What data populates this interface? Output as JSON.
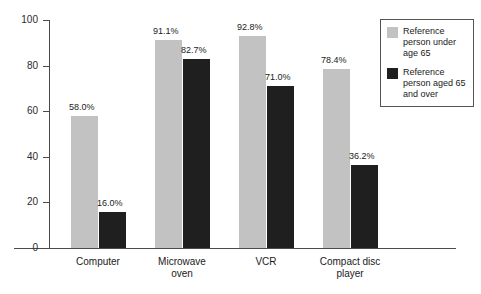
{
  "chart_data": {
    "type": "bar",
    "title": "",
    "subtitle": "",
    "xlabel": "",
    "ylabel": "",
    "ylim": [
      0,
      100
    ],
    "yticks": [
      "0",
      "20",
      "40",
      "60",
      "80",
      "100"
    ],
    "ytick_values": [
      0,
      20,
      40,
      60,
      80,
      100
    ],
    "grid": false,
    "legend_position": "top-right",
    "categories": [
      "Computer",
      "Microwave\noven",
      "VCR",
      "Compact disc\nplayer"
    ],
    "series": [
      {
        "name": "Reference person under age 65",
        "color": "#c2c2c2",
        "values": [
          58.0,
          91.1,
          92.8,
          78.4
        ],
        "labels": [
          "58.0%",
          "91.1%",
          "92.8%",
          "78.4%"
        ]
      },
      {
        "name": "Reference person aged 65 and over",
        "color": "#1f1f1f",
        "values": [
          16.0,
          82.7,
          71.0,
          36.2
        ],
        "labels": [
          "16.0%",
          "82.7%",
          "71.0%",
          "36.2%"
        ]
      }
    ]
  },
  "legend": {
    "items": [
      {
        "label": "Reference person under age 65",
        "color": "#c2c2c2"
      },
      {
        "label": "Reference person aged 65 and over",
        "color": "#1f1f1f"
      }
    ]
  },
  "colors": {
    "series_light": "#c2c2c2",
    "series_dark": "#1f1f1f",
    "axis": "#4a4a4a",
    "background": "#ffffff",
    "text": "#1a1a1a"
  }
}
